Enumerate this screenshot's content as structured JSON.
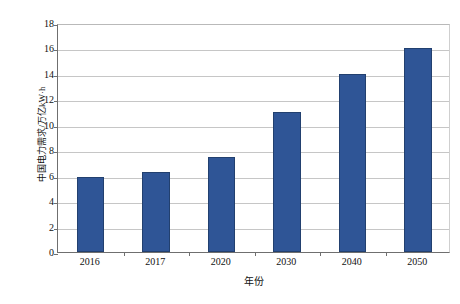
{
  "chart_data": {
    "type": "bar",
    "title": "",
    "categories": [
      "2016",
      "2017",
      "2020",
      "2030",
      "2040",
      "2050"
    ],
    "values": [
      5.9,
      6.3,
      7.5,
      11.0,
      14.0,
      16.0
    ],
    "xlabel": "年份",
    "ylabel": "中国电力需求/万亿kW·h",
    "ylim": [
      0,
      18
    ],
    "yticks": [
      0,
      2,
      4,
      6,
      8,
      10,
      12,
      14,
      16,
      18
    ],
    "ytick_labels": [
      "0",
      "2",
      "4",
      "6",
      "8",
      "10",
      "12",
      "14",
      "16",
      "18"
    ],
    "grid": true,
    "legend": null,
    "series": [
      {
        "name": "中国电力需求",
        "color": "#2f5596",
        "values": [
          5.9,
          6.3,
          7.5,
          11.0,
          14.0,
          16.0
        ]
      }
    ]
  },
  "colors": {
    "bar_fill": "#2f5596",
    "bar_edge": "#22406f",
    "gridline": "#c6c6c6",
    "axis": "#6f6f6f",
    "background": "#ffffff",
    "text": "#111111"
  }
}
